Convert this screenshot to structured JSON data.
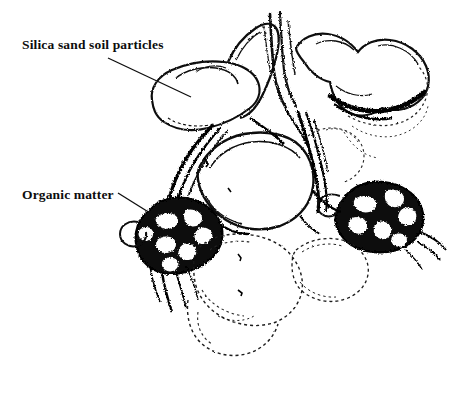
{
  "figure": {
    "kind": "scientific-line-illustration",
    "background_color": "#ffffff",
    "ink_color": "#000000",
    "width": 462,
    "height": 395
  },
  "annotations": [
    {
      "id": "silica",
      "label": "Silica sand soil particles",
      "leader_line": {
        "x1": 108,
        "y1": 58,
        "x2": 191,
        "y2": 97
      }
    },
    {
      "id": "organic",
      "label": "Organic matter",
      "leader_line": {
        "x1": 118,
        "y1": 193,
        "x2": 150,
        "y2": 213
      }
    }
  ],
  "features": {
    "sand_particles_count": 6,
    "organic_matter_masses": 2,
    "pore_channel": "vertical pore between upper particles"
  }
}
